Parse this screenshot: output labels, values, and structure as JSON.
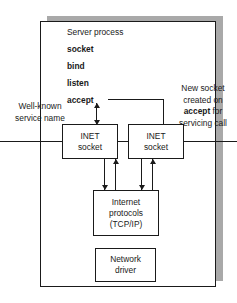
{
  "diagram": {
    "process": {
      "header": "Server process",
      "calls": [
        {
          "name": "socket-call",
          "label": "socket"
        },
        {
          "name": "bind-call",
          "label": "bind"
        },
        {
          "name": "listen-call",
          "label": "listen"
        },
        {
          "name": "accept-call",
          "label": "accept"
        }
      ]
    },
    "annotations": {
      "well_known": "Well-known\nservice name",
      "new_socket_part1": "New socket\ncreated on ",
      "new_socket_bold": "accept",
      "new_socket_part2": " for\nservicing call"
    },
    "boxes": {
      "inet_socket_left": "INET\nsocket",
      "inet_socket_right": "INET\nsocket",
      "internet_protocols": "Internet\nprotocols\n(TCP/IP)",
      "network_driver": "Network\ndriver"
    },
    "colors": {
      "stroke": "#1a1a1a",
      "shadow": "#a9a9a9",
      "background": "#ffffff"
    }
  }
}
